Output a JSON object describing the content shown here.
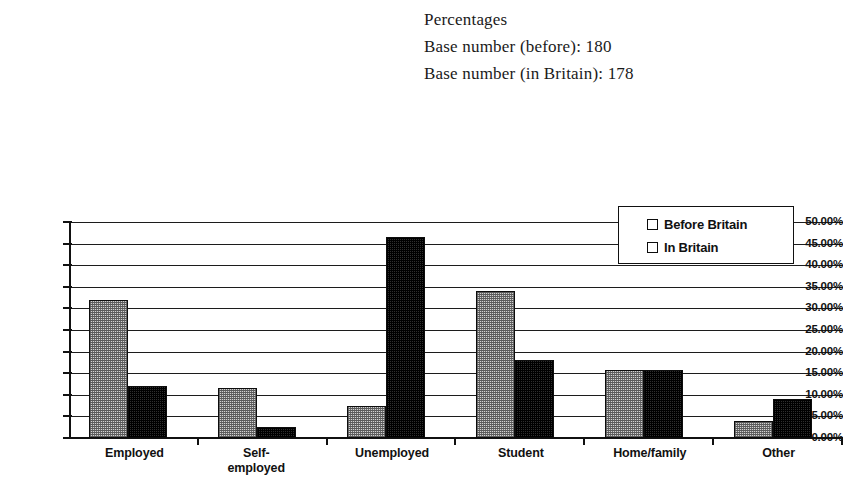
{
  "header": {
    "line1": "Percentages",
    "line2": "Base number (before): 180",
    "line3": "Base number (in Britain): 178"
  },
  "legend": {
    "items": [
      {
        "label": "Before Britain",
        "swatch": "light-dither-swatch"
      },
      {
        "label": "In Britain",
        "swatch": "dark-checker-swatch"
      }
    ]
  },
  "axis": {
    "y_ticks": [
      "0.00%",
      "5.00%",
      "10.00%",
      "15.00%",
      "20.00%",
      "25.00%",
      "30.00%",
      "35.00%",
      "40.00%",
      "45.00%",
      "50.00%"
    ]
  },
  "chart_data": {
    "type": "bar",
    "title": "",
    "subtitle": "",
    "xlabel": "",
    "ylabel": "",
    "ylim": [
      0,
      50
    ],
    "ytick_values": [
      0,
      5,
      10,
      15,
      20,
      25,
      30,
      35,
      40,
      45,
      50
    ],
    "ytick_labels": [
      "0.00%",
      "5.00%",
      "10.00%",
      "15.00%",
      "20.00%",
      "25.00%",
      "30.00%",
      "35.00%",
      "40.00%",
      "45.00%",
      "50.00%"
    ],
    "grid": true,
    "grid_axis": "y",
    "legend_position": "top-right",
    "categories": [
      "Employed",
      "Self-employed",
      "Unemployed",
      "Student",
      "Home/family",
      "Other"
    ],
    "series": [
      {
        "name": "Before Britain",
        "values": [
          32.0,
          11.5,
          7.5,
          34.0,
          15.7,
          4.0
        ]
      },
      {
        "name": "In Britain",
        "values": [
          12.0,
          2.5,
          46.5,
          18.0,
          15.7,
          9.0
        ]
      }
    ],
    "annotations": [
      "Percentages",
      "Base number (before): 180",
      "Base number (in Britain): 178"
    ]
  }
}
